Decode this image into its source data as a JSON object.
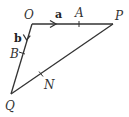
{
  "diagram": {
    "type": "vector-triangle",
    "points": {
      "O": {
        "label": "O"
      },
      "P": {
        "label": "P"
      },
      "Q": {
        "label": "Q"
      },
      "A": {
        "label": "A",
        "on": "OP"
      },
      "B": {
        "label": "B",
        "on": "OQ"
      },
      "N": {
        "label": "N",
        "on": "PQ"
      }
    },
    "vectors": {
      "a": {
        "label": "a",
        "along": "OP"
      },
      "b": {
        "label": "b",
        "along": "OQ"
      }
    },
    "colors": {
      "line": "#333333",
      "background": "#ffffff"
    }
  }
}
